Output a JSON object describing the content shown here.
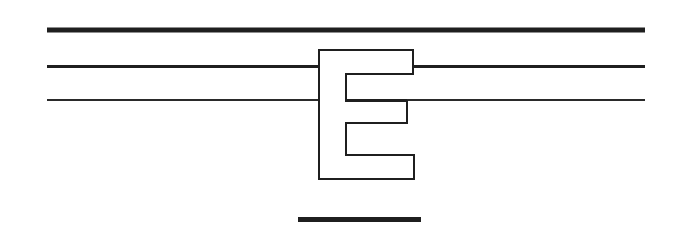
{
  "figure": {
    "letter": "E",
    "colors": {
      "background": "#ffffff",
      "stroke": "#1f1f1f",
      "letter_fill": "#ffffff"
    },
    "rules": [
      {
        "name": "top-thick-rule",
        "x1": 47,
        "x2": 645,
        "y": 30,
        "width": 5
      },
      {
        "name": "middle-rule",
        "x1": 47,
        "x2": 645,
        "y": 66.5,
        "width": 3
      },
      {
        "name": "lower-rule",
        "x1": 47,
        "x2": 645,
        "y": 100,
        "width": 2
      }
    ],
    "underline": {
      "x": 298,
      "y": 217,
      "width": 123,
      "height": 5
    },
    "letter_outline_points": "319,50 413,50 413,74 346,74 346,101 407,101 407,123 346,123 346,155 414,155 414,179 319,179"
  }
}
